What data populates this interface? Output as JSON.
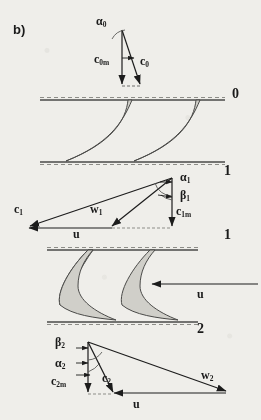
{
  "figure": {
    "panel_label": "b)",
    "caption_domain": "turbomachinery-stage-velocity-triangles"
  },
  "stations": [
    {
      "name": "station-0",
      "label": "0",
      "x": 232,
      "y": 92
    },
    {
      "name": "station-1-upper",
      "label": "1",
      "x": 226,
      "y": 168
    },
    {
      "name": "station-1-lower",
      "label": "1",
      "x": 226,
      "y": 232
    },
    {
      "name": "station-2",
      "label": "2",
      "x": 199,
      "y": 327
    }
  ],
  "triangles": [
    {
      "name": "inlet-triangle-0",
      "labels": [
        {
          "id": "alpha-0",
          "base": "α",
          "sub": "0",
          "x": 97,
          "y": 18
        },
        {
          "id": "c-0m",
          "base": "c",
          "sub": "0m",
          "x": 97,
          "y": 58
        },
        {
          "id": "c-0",
          "base": "c",
          "sub": "0",
          "x": 140,
          "y": 60
        }
      ]
    },
    {
      "name": "rotor-inlet-triangle-1",
      "labels": [
        {
          "id": "alpha-1",
          "base": "α",
          "sub": "1",
          "x": 180,
          "y": 172
        },
        {
          "id": "beta-1",
          "base": "β",
          "sub": "1",
          "x": 180,
          "y": 191
        },
        {
          "id": "c-1",
          "base": "c",
          "sub": "1",
          "x": 17,
          "y": 205
        },
        {
          "id": "w-1",
          "base": "w",
          "sub": "1",
          "x": 92,
          "y": 205
        },
        {
          "id": "c-1m",
          "base": "c",
          "sub": "1m",
          "x": 176,
          "y": 208
        },
        {
          "id": "u-1",
          "base": "u",
          "sub": "",
          "x": 75,
          "y": 229
        }
      ]
    },
    {
      "name": "rotor-exit-triangle-2",
      "labels": [
        {
          "id": "beta-2",
          "base": "β",
          "sub": "2",
          "x": 57,
          "y": 339
        },
        {
          "id": "alpha-2",
          "base": "α",
          "sub": "2",
          "x": 57,
          "y": 361
        },
        {
          "id": "c-2m",
          "base": "c",
          "sub": "2m",
          "x": 52,
          "y": 378
        },
        {
          "id": "c-2",
          "base": "c",
          "sub": "2",
          "x": 103,
          "y": 375
        },
        {
          "id": "w-2",
          "base": "w",
          "sub": "2",
          "x": 202,
          "y": 372
        },
        {
          "id": "u-2",
          "base": "u",
          "sub": "",
          "x": 135,
          "y": 400
        }
      ]
    }
  ],
  "cascades": [
    {
      "name": "stator-cascade",
      "top_line_y": 100,
      "bottom_line_y": 162,
      "blade_count": 2
    },
    {
      "name": "rotor-cascade",
      "top_line_y": 250,
      "bottom_line_y": 322,
      "blade_count": 2
    }
  ],
  "blade_speed_arrow": {
    "name": "rotor-blade-speed-arrow",
    "label": "u",
    "label_x": 199,
    "label_y": 289,
    "from_x": 258,
    "to_x": 152,
    "y": 284,
    "direction": "left"
  },
  "colors": {
    "background": "#efeeea",
    "ink": "#1c1c1c",
    "blade_fill": "#d0cfc9",
    "blade_stroke": "#4a4a48",
    "dashed_line": "#8d8d88"
  }
}
